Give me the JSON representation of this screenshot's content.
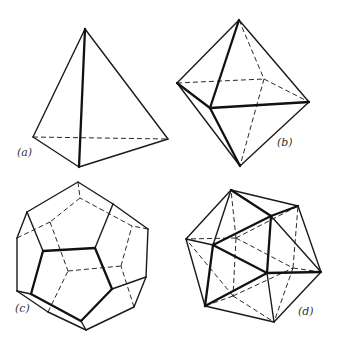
{
  "figure": {
    "type": "platonic-solids-wireframes",
    "colors": {
      "line": "#1a1a1a",
      "background": "#ffffff",
      "label": "#333333"
    },
    "panels": [
      {
        "id": "a",
        "label": "(a)",
        "label_pos": [
          17,
          156
        ],
        "name": "tetrahedron",
        "vertices": {
          "T": [
            85,
            29
          ],
          "L": [
            33,
            137
          ],
          "F": [
            79,
            167
          ],
          "R": [
            168,
            139
          ]
        },
        "solid": [
          [
            "T",
            "L"
          ],
          [
            "T",
            "R"
          ],
          [
            "L",
            "F"
          ],
          [
            "F",
            "R"
          ]
        ],
        "bold": [
          [
            "T",
            "F"
          ]
        ],
        "dashed": [
          [
            "L",
            "R"
          ]
        ]
      },
      {
        "id": "b",
        "label": "(b)",
        "label_pos": [
          277,
          146
        ],
        "name": "octahedron",
        "vertices": {
          "T": [
            239,
            20
          ],
          "L": [
            177,
            83
          ],
          "F": [
            210,
            108
          ],
          "R": [
            309,
            102
          ],
          "B": [
            240,
            166
          ],
          "K": [
            264,
            79
          ]
        },
        "solid": [
          [
            "T",
            "L"
          ],
          [
            "T",
            "R"
          ],
          [
            "L",
            "B"
          ],
          [
            "R",
            "B"
          ]
        ],
        "bold": [
          [
            "T",
            "F"
          ],
          [
            "F",
            "R"
          ],
          [
            "L",
            "F"
          ],
          [
            "F",
            "B"
          ]
        ],
        "dashed": [
          [
            "L",
            "K"
          ],
          [
            "K",
            "R"
          ],
          [
            "T",
            "K"
          ],
          [
            "K",
            "B"
          ]
        ]
      },
      {
        "id": "c",
        "label": "(c)",
        "label_pos": [
          15,
          312
        ],
        "name": "dodecahedron",
        "vertices": {
          "A": [
            43,
            251
          ],
          "B": [
            95,
            248
          ],
          "C": [
            112,
            289
          ],
          "D": [
            81,
            321
          ],
          "E": [
            31,
            294
          ],
          "P1": [
            27,
            212
          ],
          "P2": [
            113,
            204
          ],
          "P3": [
            146,
            277
          ],
          "P4": [
            86,
            330
          ],
          "P5": [
            17,
            291
          ],
          "Q1": [
            78,
            182
          ],
          "Q2": [
            148,
            229
          ],
          "Q3": [
            134,
            307
          ],
          "Q4": [
            48,
            312
          ],
          "Q5": [
            17,
            238
          ],
          "R1": [
            80,
            198
          ],
          "R2": [
            50,
            222
          ],
          "R3": [
            68,
            271
          ],
          "R4": [
            121,
            266
          ],
          "R5": [
            132,
            226
          ]
        },
        "bold": [
          [
            "A",
            "B"
          ],
          [
            "B",
            "C"
          ],
          [
            "C",
            "D"
          ],
          [
            "D",
            "E"
          ],
          [
            "E",
            "A"
          ]
        ],
        "solid": [
          [
            "A",
            "P1"
          ],
          [
            "B",
            "P2"
          ],
          [
            "C",
            "P3"
          ],
          [
            "D",
            "P4"
          ],
          [
            "E",
            "P5"
          ],
          [
            "P1",
            "Q1"
          ],
          [
            "Q1",
            "P2"
          ],
          [
            "P2",
            "Q2"
          ],
          [
            "Q2",
            "P3"
          ],
          [
            "P3",
            "Q3"
          ],
          [
            "Q3",
            "P4"
          ],
          [
            "P4",
            "Q4"
          ],
          [
            "Q4",
            "P5"
          ],
          [
            "P5",
            "Q5"
          ],
          [
            "Q5",
            "P1"
          ]
        ],
        "dashed": [
          [
            "Q1",
            "R1"
          ],
          [
            "Q5",
            "R2"
          ],
          [
            "Q4",
            "R3"
          ],
          [
            "Q3",
            "R4"
          ],
          [
            "Q2",
            "R5"
          ],
          [
            "R1",
            "R2"
          ],
          [
            "R2",
            "R3"
          ],
          [
            "R3",
            "R4"
          ],
          [
            "R4",
            "R5"
          ],
          [
            "R5",
            "R1"
          ]
        ]
      },
      {
        "id": "d",
        "label": "(d)",
        "label_pos": [
          298,
          315
        ],
        "name": "icosahedron",
        "vertices": {
          "T1": [
            231,
            190
          ],
          "T2": [
            298,
            206
          ],
          "L": [
            186,
            239
          ],
          "F1": [
            271,
            216
          ],
          "F2": [
            213,
            245
          ],
          "F3": [
            267,
            273
          ],
          "R": [
            321,
            272
          ],
          "BL": [
            205,
            306
          ],
          "B": [
            274,
            322
          ],
          "H1": [
            236,
            238
          ],
          "H2": [
            233,
            296
          ],
          "H3": [
            293,
            268
          ]
        },
        "bold": [
          [
            "F1",
            "F2"
          ],
          [
            "F1",
            "F3"
          ],
          [
            "F2",
            "F3"
          ],
          [
            "T1",
            "F1"
          ],
          [
            "F2",
            "BL"
          ],
          [
            "F3",
            "R"
          ],
          [
            "F1",
            "T2"
          ],
          [
            "F3",
            "BL"
          ]
        ],
        "solid": [
          [
            "T1",
            "T2"
          ],
          [
            "T1",
            "L"
          ],
          [
            "T1",
            "F2"
          ],
          [
            "T2",
            "R"
          ],
          [
            "L",
            "F2"
          ],
          [
            "L",
            "BL"
          ],
          [
            "F1",
            "R"
          ],
          [
            "F3",
            "B"
          ],
          [
            "R",
            "B"
          ],
          [
            "BL",
            "B"
          ]
        ],
        "dashed": [
          [
            "H1",
            "T1"
          ],
          [
            "H1",
            "L"
          ],
          [
            "H1",
            "T2"
          ],
          [
            "H1",
            "H2"
          ],
          [
            "H1",
            "H3"
          ],
          [
            "H2",
            "L"
          ],
          [
            "H2",
            "BL"
          ],
          [
            "H2",
            "B"
          ],
          [
            "H2",
            "H3"
          ],
          [
            "H3",
            "T2"
          ],
          [
            "H3",
            "R"
          ],
          [
            "H3",
            "B"
          ]
        ]
      }
    ]
  }
}
